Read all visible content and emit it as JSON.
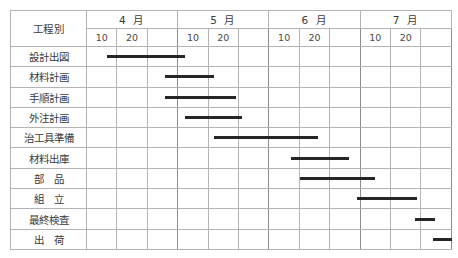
{
  "chart_data": {
    "type": "bar",
    "chart_kind": "gantt",
    "title": "",
    "xlabel": "",
    "ylabel": "",
    "header": {
      "category_column_label": "工程別",
      "months": [
        {
          "label": "4 月",
          "ticks": [
            "10",
            "20"
          ]
        },
        {
          "label": "5 月",
          "ticks": [
            "10",
            "20"
          ]
        },
        {
          "label": "6 月",
          "ticks": [
            "10",
            "20"
          ]
        },
        {
          "label": "7 月",
          "ticks": [
            "10",
            "20"
          ]
        }
      ],
      "tick_blank": ""
    },
    "axis": {
      "month_count": 4,
      "subcolumns_per_month": 3,
      "x_start_month": 4,
      "x_end_month": 7,
      "grid": true
    },
    "categories": [
      "設計出図",
      "材料計画",
      "手順計画",
      "外注計画",
      "治工具準備",
      "材料出庫",
      "部　品",
      "組　立",
      "最終検査",
      "出　荷"
    ],
    "tasks": [
      {
        "name": "設計出図",
        "start_pct": 5.5,
        "end_pct": 27.0
      },
      {
        "name": "材料計画",
        "start_pct": 21.5,
        "end_pct": 35.0
      },
      {
        "name": "手順計画",
        "start_pct": 21.5,
        "end_pct": 41.0
      },
      {
        "name": "外注計画",
        "start_pct": 27.0,
        "end_pct": 42.5
      },
      {
        "name": "治工具準備",
        "start_pct": 35.0,
        "end_pct": 63.5
      },
      {
        "name": "材料出庫",
        "start_pct": 56.0,
        "end_pct": 72.0
      },
      {
        "name": "部　品",
        "start_pct": 58.5,
        "end_pct": 79.0
      },
      {
        "name": "組　立",
        "start_pct": 74.0,
        "end_pct": 90.5
      },
      {
        "name": "最終検査",
        "start_pct": 90.0,
        "end_pct": 95.5
      },
      {
        "name": "出　荷",
        "start_pct": 95.0,
        "end_pct": 100.0
      }
    ],
    "colors": {
      "bar": "#262626",
      "grid": "#b4b4b4",
      "border": "#8c8c8c",
      "background": "#ffffff",
      "text": "#3a3a3a"
    }
  }
}
